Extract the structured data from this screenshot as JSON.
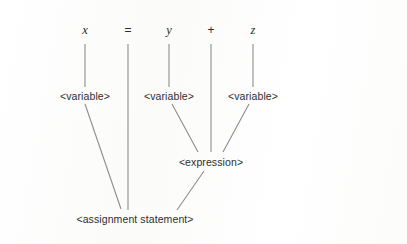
{
  "figure": {
    "kind": "parse-tree",
    "caption": "",
    "background_color": "#fdfdfd",
    "edge_color": "#8d8d8d",
    "text_color": "#2e2e2e"
  },
  "tokens": [
    {
      "id": "tok-x",
      "text": "x",
      "style": "italic",
      "x": 85,
      "y": 30
    },
    {
      "id": "tok-eq",
      "text": "=",
      "style": "operator",
      "x": 128,
      "y": 30
    },
    {
      "id": "tok-y",
      "text": "y",
      "style": "italic",
      "x": 169,
      "y": 30
    },
    {
      "id": "tok-plus",
      "text": "+",
      "style": "operator",
      "x": 211,
      "y": 30
    },
    {
      "id": "tok-z",
      "text": "z",
      "style": "italic",
      "x": 253,
      "y": 30
    }
  ],
  "nodes": [
    {
      "id": "var-x",
      "text": "<variable>",
      "x": 85,
      "y": 96
    },
    {
      "id": "var-y",
      "text": "<variable>",
      "x": 169,
      "y": 96
    },
    {
      "id": "var-z",
      "text": "<variable>",
      "x": 253,
      "y": 96
    },
    {
      "id": "expression",
      "text": "<expression>",
      "x": 211,
      "y": 162
    },
    {
      "id": "assignment",
      "text": "<assignment statement>",
      "x": 135,
      "y": 219
    }
  ],
  "edges": [
    {
      "id": "edge-x-var",
      "from": "tok-x",
      "to": "var-x",
      "x1": 85,
      "y1": 44,
      "x2": 85,
      "y2": 87
    },
    {
      "id": "edge-y-var",
      "from": "tok-y",
      "to": "var-y",
      "x1": 169,
      "y1": 44,
      "x2": 169,
      "y2": 87
    },
    {
      "id": "edge-z-var",
      "from": "tok-z",
      "to": "var-z",
      "x1": 253,
      "y1": 44,
      "x2": 253,
      "y2": 87
    },
    {
      "id": "edge-eq-assign",
      "from": "tok-eq",
      "to": "assignment",
      "x1": 128,
      "y1": 44,
      "x2": 128,
      "y2": 210
    },
    {
      "id": "edge-plus-expr",
      "from": "tok-plus",
      "to": "expression",
      "x1": 211,
      "y1": 44,
      "x2": 211,
      "y2": 152
    },
    {
      "id": "edge-varx-assign",
      "from": "var-x",
      "to": "assignment",
      "x1": 85,
      "y1": 104,
      "x2": 121,
      "y2": 209
    },
    {
      "id": "edge-vary-expr",
      "from": "var-y",
      "to": "expression",
      "x1": 172,
      "y1": 104,
      "x2": 198,
      "y2": 152
    },
    {
      "id": "edge-varz-expr",
      "from": "var-z",
      "to": "expression",
      "x1": 249,
      "y1": 104,
      "x2": 223,
      "y2": 152
    },
    {
      "id": "edge-expr-assign",
      "from": "expression",
      "to": "assignment",
      "x1": 204,
      "y1": 171,
      "x2": 177,
      "y2": 210
    }
  ]
}
